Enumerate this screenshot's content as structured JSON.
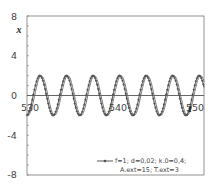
{
  "chart_data": {
    "type": "line",
    "title": "",
    "xlabel": "t",
    "ylabel": "x",
    "xlim": [
      530,
      550
    ],
    "ylim": [
      -8,
      8
    ],
    "x_ticks": [
      "530",
      "540",
      "550"
    ],
    "y_ticks": [
      "8",
      "4",
      "0",
      "-4",
      "-8"
    ],
    "grid": false,
    "legend_position": "lower right inside",
    "series": [
      {
        "name": "f=1; d=0,02; k.0=0,4; A.ext=15; T.ext=3",
        "style": "line with diamond markers",
        "amplitude": 2.0,
        "period": 3.0,
        "phase": 0.0
      },
      {
        "name": "reference (unlabeled)",
        "style": "plain line",
        "amplitude": 2.0,
        "period": 3.0,
        "phase": 0.35
      }
    ]
  },
  "axes": {
    "y_label": "x",
    "x_label": "t",
    "y_tick_labels": [
      "8",
      "4",
      "0",
      "-4",
      "-8"
    ],
    "x_tick_labels": [
      "530",
      "540",
      "550"
    ]
  },
  "legend": {
    "line1": "f=1; d=0,02;  k.0=0,4;",
    "line2": "A.ext=15;  T.ext=3"
  },
  "colors": {
    "curve": "#555555",
    "axis": "#555555",
    "frame": "#666666"
  }
}
